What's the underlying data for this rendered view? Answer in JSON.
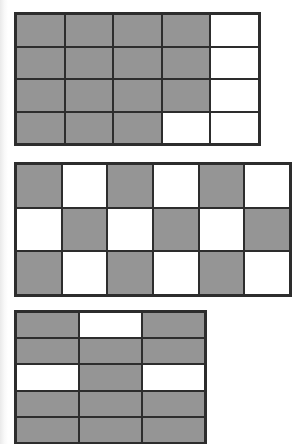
{
  "page": {
    "background_color": "#ffffff",
    "line_color": "#2d2d2d",
    "shaded_color": "#959595",
    "unshaded_color": "#ffffff"
  },
  "grids": [
    {
      "name": "top-grid",
      "rows": 4,
      "cols": 5,
      "shaded_count": 15,
      "total_cells": 20,
      "shaded_fraction": "15/20",
      "cells": [
        [
          1,
          1,
          1,
          1,
          0
        ],
        [
          1,
          1,
          1,
          1,
          0
        ],
        [
          1,
          1,
          1,
          1,
          0
        ],
        [
          1,
          1,
          1,
          0,
          0
        ]
      ]
    },
    {
      "name": "middle-grid",
      "rows": 3,
      "cols": 6,
      "shaded_count": 9,
      "total_cells": 18,
      "shaded_fraction": "9/18",
      "cells": [
        [
          1,
          0,
          1,
          0,
          1,
          0
        ],
        [
          0,
          1,
          0,
          1,
          0,
          1
        ],
        [
          1,
          0,
          1,
          0,
          1,
          0
        ]
      ]
    },
    {
      "name": "bottom-grid",
      "rows": 5,
      "cols": 3,
      "shaded_count": 12,
      "total_cells": 15,
      "shaded_fraction": "12/15",
      "clipped_at_bottom": true,
      "cells": [
        [
          1,
          0,
          1
        ],
        [
          1,
          1,
          1
        ],
        [
          0,
          1,
          0
        ],
        [
          1,
          1,
          1
        ],
        [
          1,
          1,
          1
        ]
      ]
    }
  ]
}
